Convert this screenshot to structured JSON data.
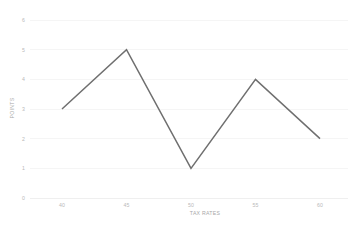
{
  "chart_data": {
    "type": "line",
    "title": "",
    "subtitle": "",
    "xlabel": "TAX RATES",
    "ylabel": "POINTS",
    "x": [
      40,
      45,
      50,
      55,
      60
    ],
    "categories": [
      "40",
      "45",
      "50",
      "55",
      "60"
    ],
    "values": [
      3,
      5,
      1,
      4,
      2
    ],
    "series": [
      {
        "name": "",
        "values": [
          3,
          5,
          1,
          4,
          2
        ]
      }
    ],
    "xlim": [
      37.5,
      62.5
    ],
    "ylim": [
      0,
      6
    ],
    "x_ticks": [
      "40",
      "45",
      "50",
      "55",
      "60"
    ],
    "y_ticks": [
      "0",
      "1",
      "2",
      "3",
      "4",
      "5",
      "6"
    ],
    "grid": "horizontal",
    "legend": "none",
    "markers": "none",
    "line_color": "#6f6f6f",
    "grid_color": "#f2f2f2",
    "background_color": "#ffffff",
    "tick_label_color": "#b9b9b9",
    "axis_title_color": "#a8a8a8",
    "annotations": []
  }
}
